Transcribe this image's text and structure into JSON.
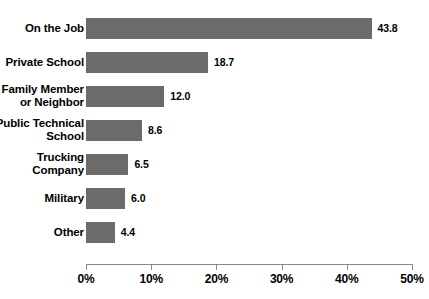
{
  "chart_data": {
    "type": "bar",
    "orientation": "horizontal",
    "title": "",
    "xlabel": "",
    "ylabel": "",
    "categories": [
      "On the Job",
      "Private School",
      "Family Member or Neighbor",
      "Public Technical School",
      "Trucking Company",
      "Military",
      "Other"
    ],
    "category_lines": [
      [
        "On the Job"
      ],
      [
        "Private School"
      ],
      [
        "Family Member",
        "or Neighbor"
      ],
      [
        "Public Technical",
        "School"
      ],
      [
        "Trucking",
        "Company"
      ],
      [
        "Military"
      ],
      [
        "Other"
      ]
    ],
    "values": [
      43.8,
      18.7,
      12.0,
      8.6,
      6.5,
      6.0,
      4.4
    ],
    "value_labels": [
      "43.8",
      "18.7",
      "12.0",
      "8.6",
      "6.5",
      "6.0",
      "4.4"
    ],
    "xlim": [
      0,
      50
    ],
    "xticks": [
      0,
      10,
      20,
      30,
      40,
      50
    ],
    "xtick_labels": [
      "0%",
      "10%",
      "20%",
      "30%",
      "40%",
      "50%"
    ],
    "grid": false,
    "legend": false,
    "bar_color": "#6b6b6b",
    "axis_color": "#8a8a8a",
    "text_color": "#000000",
    "background_color": "#ffffff"
  }
}
